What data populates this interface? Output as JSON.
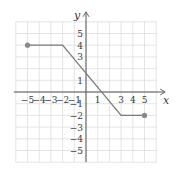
{
  "chart_data": {
    "type": "line",
    "title": "",
    "xlabel": "x",
    "ylabel": "y",
    "xlim": [
      -6,
      6
    ],
    "ylim": [
      -6,
      6
    ],
    "grid": true,
    "x_ticks": [
      -5,
      -4,
      -3,
      -2,
      -1,
      1,
      3,
      4,
      5
    ],
    "y_ticks": [
      5,
      4,
      3,
      1,
      -1,
      -2,
      -3,
      -4,
      -5
    ],
    "series": [
      {
        "name": "f",
        "points": [
          [
            -5,
            4
          ],
          [
            -2,
            4
          ],
          [
            3,
            -2
          ],
          [
            5,
            -2
          ]
        ],
        "endpoints_closed": [
          [
            -5,
            4
          ],
          [
            5,
            -2
          ]
        ]
      }
    ]
  },
  "colors": {
    "grid": "#dddddd",
    "axis": "#555555",
    "line": "#7a7a7a",
    "point": "#8a8a8a"
  }
}
